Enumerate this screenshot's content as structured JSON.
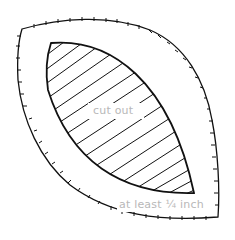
{
  "diagram": {
    "type": "sewing-pattern-template",
    "shapes": {
      "outer": {
        "name": "seam-allowance-outline",
        "style": "stitched line with tick marks",
        "stroke": "#111111"
      },
      "inner": {
        "name": "cut-out-leaf",
        "style": "solid outline with diagonal hatching",
        "stroke": "#111111"
      }
    },
    "labels": {
      "inner": "cut out",
      "margin": "at least ¼ inch"
    },
    "colors": {
      "line": "#111111",
      "label": "#b8b8b8",
      "background": "#ffffff"
    }
  }
}
